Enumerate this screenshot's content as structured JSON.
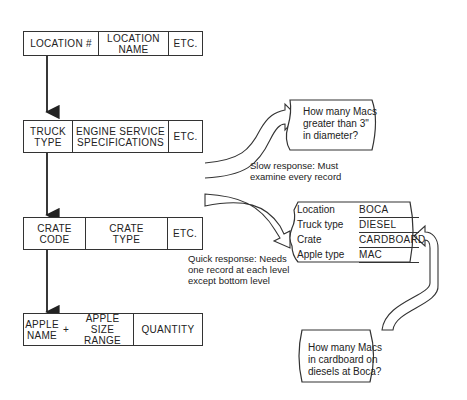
{
  "records": [
    {
      "fields": [
        "LOCATION #",
        "LOCATION\nNAME",
        "ETC."
      ]
    },
    {
      "fields": [
        "TRUCK\nTYPE",
        "ENGINE SERVICE\nSPECIFICATIONS",
        "ETC."
      ]
    },
    {
      "fields": [
        "CRATE\nCODE",
        "CRATE\nTYPE",
        "ETC."
      ]
    },
    {
      "fields": [
        "APPLE\nNAME",
        "+",
        "APPLE\nSIZE RANGE",
        "QUANTITY"
      ]
    }
  ],
  "query_slow": {
    "question": "How many Macs\ngreater than 3\"\nin diameter?",
    "response": "Slow response:  Must\nexamine every record"
  },
  "query_quick": {
    "response": "Quick response:  Needs\none record at each level\nexcept bottom level",
    "keys": [
      {
        "label": "Location",
        "value": "BOCA"
      },
      {
        "label": "Truck type",
        "value": "DIESEL"
      },
      {
        "label": "Crate",
        "value": "CARDBOARD"
      },
      {
        "label": "Apple type",
        "value": "MAC"
      }
    ],
    "question": "How many Macs\nin cardboard on\ndiesels at Boca?"
  }
}
